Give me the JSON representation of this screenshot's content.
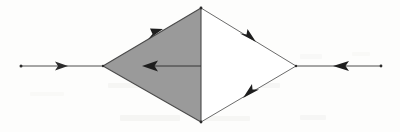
{
  "figure": {
    "kind": "line-diagram",
    "caption": "",
    "background_color": "#fdfdfc",
    "stroke_color": "#3a3a3a",
    "shaded_fill_color": "#9a9a9a",
    "unshaded_fill_color": "#ffffff",
    "canvas": {
      "width": 400,
      "height": 132
    }
  },
  "geometry": {
    "vertices": {
      "apex_top": {
        "x": 201,
        "y": 8,
        "label": ""
      },
      "apex_bottom": {
        "x": 201,
        "y": 122,
        "label": ""
      },
      "vertex_left": {
        "x": 103,
        "y": 66,
        "label": ""
      },
      "vertex_right": {
        "x": 296,
        "y": 66,
        "label": ""
      }
    },
    "endpoints": {
      "tail_left": {
        "x": 21,
        "y": 66,
        "label": ""
      },
      "tail_right": {
        "x": 381,
        "y": 66,
        "label": ""
      }
    },
    "divider": {
      "name": "central-vertical-line",
      "from": {
        "x": 201,
        "y": 8
      },
      "to": {
        "x": 201,
        "y": 122
      }
    }
  },
  "regions": [
    {
      "name": "shaded-left-triangle",
      "fill": "#9a9a9a",
      "points": "103,66 201,8 201,122"
    },
    {
      "name": "unshaded-right-triangle",
      "fill": "#ffffff",
      "points": "201,8 296,66 201,122"
    }
  ],
  "arrows": [
    {
      "name": "incoming-left-arrow",
      "from": {
        "x": 21,
        "y": 66
      },
      "to": {
        "x": 103,
        "y": 66
      },
      "head_at": {
        "x": 66,
        "y": 66
      },
      "direction": "right",
      "has_dot_tail": true,
      "weight": 1.0
    },
    {
      "name": "interior-horizontal-arrow",
      "from": {
        "x": 201,
        "y": 66
      },
      "to": {
        "x": 142,
        "y": 66
      },
      "head_at": {
        "x": 148,
        "y": 66
      },
      "direction": "left",
      "has_dot_tail": false,
      "weight": 1.0
    },
    {
      "name": "upper-left-edge-arrow",
      "from": {
        "x": 103,
        "y": 66
      },
      "to": {
        "x": 201,
        "y": 8
      },
      "head_at": {
        "x": 160,
        "y": 32
      },
      "direction": "up-right",
      "has_dot_tail": false,
      "weight": 0.9
    },
    {
      "name": "lower-left-edge",
      "from": {
        "x": 103,
        "y": 66
      },
      "to": {
        "x": 201,
        "y": 122
      },
      "head_at": null,
      "direction": "down-right",
      "has_dot_tail": false,
      "weight": 0.9
    },
    {
      "name": "upper-right-edge-arrow",
      "from": {
        "x": 201,
        "y": 8
      },
      "to": {
        "x": 296,
        "y": 66
      },
      "head_at": {
        "x": 252,
        "y": 39
      },
      "direction": "down-right",
      "has_dot_tail": false,
      "weight": 0.9
    },
    {
      "name": "lower-right-edge-arrow",
      "from": {
        "x": 296,
        "y": 66
      },
      "to": {
        "x": 201,
        "y": 122
      },
      "head_at": {
        "x": 250,
        "y": 94
      },
      "direction": "down-left",
      "has_dot_tail": false,
      "weight": 0.9
    },
    {
      "name": "incoming-right-arrow",
      "from": {
        "x": 381,
        "y": 66
      },
      "to": {
        "x": 296,
        "y": 66
      },
      "head_at": {
        "x": 340,
        "y": 66
      },
      "direction": "left",
      "has_dot_tail": true,
      "weight": 1.0
    }
  ],
  "labels": []
}
